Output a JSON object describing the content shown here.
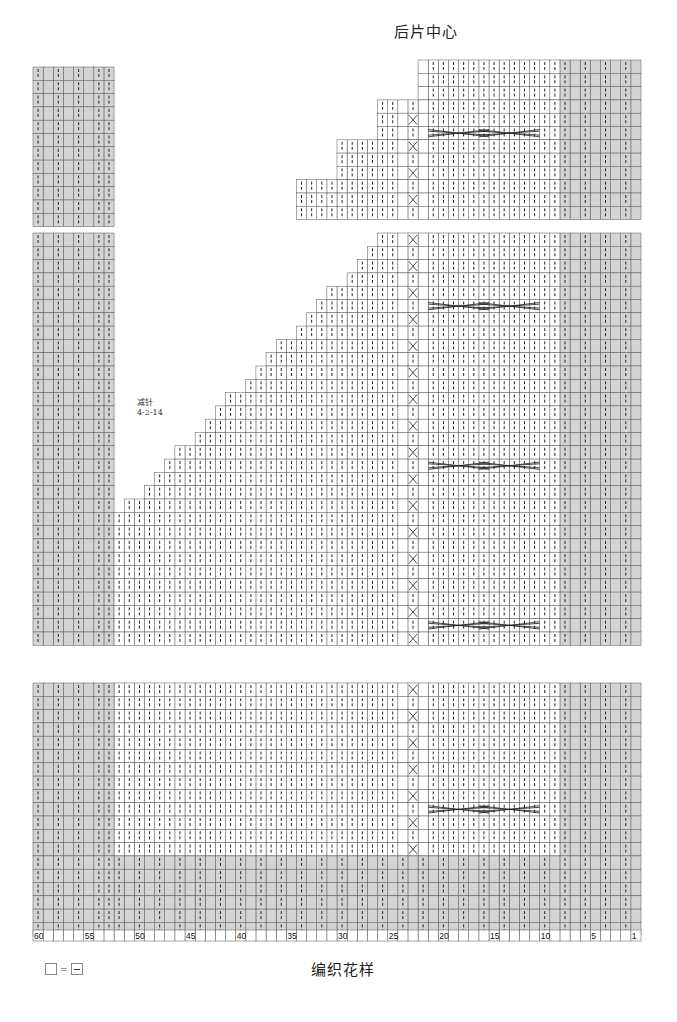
{
  "diagram": {
    "title_top": "后片中心",
    "caption": "编织花样",
    "decrease_note": {
      "label": "减针",
      "value": "4-2-14"
    },
    "legend": {
      "symbol_left": "knit-blank",
      "equals": "=",
      "symbol_right": "purl-dash"
    },
    "colors": {
      "shade": "#d4d4d4",
      "grid": "#555555",
      "stitch": "#222222",
      "background": "#ffffff"
    },
    "axis": {
      "columns_total": 60,
      "labels": [
        60,
        55,
        50,
        45,
        40,
        35,
        30,
        25,
        20,
        15,
        10,
        5,
        1
      ]
    },
    "symbols": {
      "vertical_bar": "knit stitch (|)",
      "cross": "twist stitch (X)",
      "cable": "cable cross (long X spanning 6 stitches)"
    },
    "sections": [
      {
        "name": "top-section",
        "description": "shoulder / back center top, with stepped neckline decreases"
      },
      {
        "name": "middle-section",
        "description": "armhole section with raglan decrease 4-2-14"
      },
      {
        "name": "bottom-section",
        "description": "body with ribbed shaded border"
      }
    ]
  }
}
